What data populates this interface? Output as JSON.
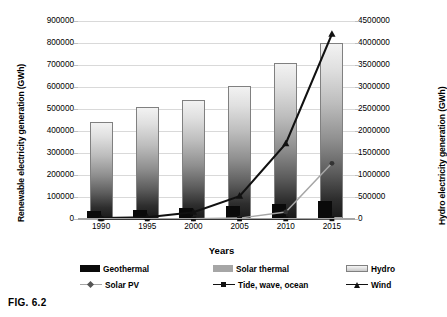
{
  "figure": {
    "caption": "FIG. 6.2"
  },
  "chart_data": {
    "type": "bar",
    "title": "",
    "xlabel": "Years",
    "ylabel": "Renewable electricity generation (GWh)",
    "y2label": "Hydro electricity generation (GWh)",
    "categories": [
      "1990",
      "1995",
      "2000",
      "2005",
      "2010",
      "2015"
    ],
    "ylim": [
      0,
      900000
    ],
    "y2lim": [
      0,
      4500000
    ],
    "yticks": [
      "0",
      "100000",
      "200000",
      "300000",
      "400000",
      "500000",
      "600000",
      "700000",
      "800000",
      "900000"
    ],
    "y2ticks": [
      "0",
      "500000",
      "1000000",
      "1500000",
      "2000000",
      "2500000",
      "3000000",
      "3500000",
      "4000000",
      "4500000"
    ],
    "grid": true,
    "legend_position": "bottom",
    "series": [
      {
        "name": "Geothermal",
        "kind": "bar",
        "axis": "left",
        "color": "#0a0a0a",
        "values": [
          36000,
          39000,
          49000,
          58000,
          68000,
          81000
        ]
      },
      {
        "name": "Solar thermal",
        "kind": "bar",
        "axis": "left",
        "color": "#a6a6a6",
        "values": [
          700,
          800,
          500,
          900,
          1600,
          10000
        ]
      },
      {
        "name": "Hydro",
        "kind": "bar",
        "axis": "right",
        "color": "#cccccc",
        "values": [
          2200000,
          2550000,
          2705000,
          3035000,
          3540000,
          4010000
        ]
      },
      {
        "name": "Solar PV",
        "kind": "line",
        "axis": "left",
        "color": "#a6a6a6",
        "marker": "diamond",
        "values": [
          200,
          400,
          1100,
          4000,
          32000,
          253000
        ]
      },
      {
        "name": "Tide, wave, ocean",
        "kind": "line",
        "axis": "left",
        "color": "#111111",
        "marker": "square",
        "values": [
          550,
          560,
          550,
          550,
          520,
          1000
        ]
      },
      {
        "name": "Wind",
        "kind": "line",
        "axis": "left",
        "color": "#111111",
        "marker": "triangle",
        "values": [
          3800,
          8000,
          31000,
          104000,
          342000,
          840000
        ]
      }
    ]
  },
  "legend": {
    "row1": [
      {
        "label": "Geothermal",
        "swatch": "box-black"
      },
      {
        "label": "Solar thermal",
        "swatch": "box-gray"
      },
      {
        "label": "Hydro",
        "swatch": "box-gradient"
      }
    ],
    "row2": [
      {
        "label": "Solar PV",
        "swatch": "line-diamond"
      },
      {
        "label": "Tide, wave, ocean",
        "swatch": "line-square"
      },
      {
        "label": "Wind",
        "swatch": "line-triangle"
      }
    ]
  }
}
